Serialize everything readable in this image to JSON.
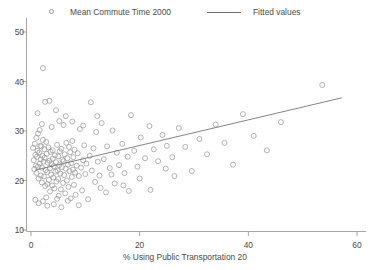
{
  "legend": {
    "entries": [
      {
        "label": "Mean Commute Time 2000",
        "marker": "circle-marker-icon"
      },
      {
        "label": "Fitted values",
        "marker": "line-marker-icon"
      }
    ]
  },
  "axes": {
    "xlabel": "% Using Public Transportation 20",
    "ylabel": "",
    "xticks": [
      "0",
      "20",
      "40",
      "60"
    ],
    "yticks": [
      "10",
      "20",
      "30",
      "40",
      "50"
    ]
  },
  "colors": {
    "marker": "#9a9a9a",
    "line": "#6e6e6e",
    "axis": "#8f8f8f",
    "text": "#4a4a4a",
    "background": "#ffffff"
  },
  "chart_data": {
    "type": "scatter",
    "title": "",
    "xlabel": "% Using Public Transportation 20",
    "ylabel": "",
    "xlim": [
      0,
      60
    ],
    "ylim": [
      10,
      52
    ],
    "xticks": [
      0,
      20,
      40,
      60
    ],
    "yticks": [
      10,
      20,
      30,
      40,
      50
    ],
    "grid": false,
    "legend_position": "top",
    "series": [
      {
        "name": "Mean Commute Time 2000",
        "type": "scatter",
        "marker": "open-circle",
        "points": [
          [
            0.4,
            26.6
          ],
          [
            0.5,
            24.1
          ],
          [
            0.6,
            22.3
          ],
          [
            0.7,
            27.4
          ],
          [
            0.8,
            25.2
          ],
          [
            0.9,
            23.0
          ],
          [
            1.0,
            28.6
          ],
          [
            1.0,
            21.5
          ],
          [
            1.1,
            24.8
          ],
          [
            1.2,
            26.0
          ],
          [
            1.3,
            22.8
          ],
          [
            1.3,
            29.5
          ],
          [
            1.4,
            20.4
          ],
          [
            1.5,
            25.6
          ],
          [
            1.6,
            23.4
          ],
          [
            1.7,
            27.0
          ],
          [
            1.8,
            21.0
          ],
          [
            1.8,
            24.3
          ],
          [
            1.9,
            26.9
          ],
          [
            2.0,
            19.6
          ],
          [
            2.0,
            22.6
          ],
          [
            2.1,
            25.0
          ],
          [
            2.2,
            42.7
          ],
          [
            2.2,
            28.2
          ],
          [
            2.3,
            23.8
          ],
          [
            2.4,
            20.8
          ],
          [
            2.5,
            26.3
          ],
          [
            2.5,
            24.6
          ],
          [
            2.6,
            18.9
          ],
          [
            2.7,
            22.1
          ],
          [
            2.8,
            27.8
          ],
          [
            2.9,
            25.4
          ],
          [
            3.0,
            21.7
          ],
          [
            3.0,
            19.3
          ],
          [
            3.1,
            23.6
          ],
          [
            3.2,
            26.7
          ],
          [
            3.3,
            20.1
          ],
          [
            3.4,
            24.0
          ],
          [
            3.5,
            22.5
          ],
          [
            3.5,
            17.8
          ],
          [
            3.6,
            25.8
          ],
          [
            3.7,
            21.2
          ],
          [
            3.8,
            23.3
          ],
          [
            3.9,
            19.0
          ],
          [
            4.0,
            26.1
          ],
          [
            4.0,
            24.4
          ],
          [
            4.1,
            20.6
          ],
          [
            4.2,
            22.9
          ],
          [
            4.3,
            18.4
          ],
          [
            4.4,
            25.1
          ],
          [
            4.5,
            21.8
          ],
          [
            4.6,
            23.7
          ],
          [
            4.7,
            19.8
          ],
          [
            4.8,
            27.2
          ],
          [
            4.9,
            22.0
          ],
          [
            5.0,
            24.9
          ],
          [
            5.0,
            20.3
          ],
          [
            5.1,
            16.9
          ],
          [
            5.2,
            23.1
          ],
          [
            5.3,
            25.9
          ],
          [
            5.4,
            21.4
          ],
          [
            5.5,
            18.2
          ],
          [
            5.6,
            26.4
          ],
          [
            5.7,
            22.7
          ],
          [
            5.8,
            24.2
          ],
          [
            5.9,
            19.5
          ],
          [
            6.0,
            23.9
          ],
          [
            6.0,
            31.2
          ],
          [
            6.1,
            21.1
          ],
          [
            6.2,
            25.3
          ],
          [
            6.3,
            17.4
          ],
          [
            6.4,
            22.4
          ],
          [
            6.5,
            27.6
          ],
          [
            6.6,
            20.0
          ],
          [
            6.7,
            24.5
          ],
          [
            6.8,
            23.2
          ],
          [
            6.9,
            18.7
          ],
          [
            7.0,
            26.8
          ],
          [
            7.1,
            21.9
          ],
          [
            7.2,
            25.7
          ],
          [
            7.3,
            16.4
          ],
          [
            7.4,
            23.5
          ],
          [
            7.5,
            20.7
          ],
          [
            7.6,
            28.0
          ],
          [
            7.7,
            22.2
          ],
          [
            7.8,
            24.7
          ],
          [
            7.9,
            19.1
          ],
          [
            8.0,
            26.2
          ],
          [
            8.1,
            21.6
          ],
          [
            8.2,
            17.1
          ],
          [
            8.4,
            23.0
          ],
          [
            8.6,
            25.5
          ],
          [
            8.8,
            20.9
          ],
          [
            9.0,
            30.4
          ],
          [
            9.2,
            22.6
          ],
          [
            9.4,
            18.0
          ],
          [
            9.6,
            24.1
          ],
          [
            9.8,
            27.1
          ],
          [
            10.0,
            21.3
          ],
          [
            10.2,
            23.4
          ],
          [
            10.5,
            16.2
          ],
          [
            10.8,
            25.0
          ],
          [
            11.0,
            35.8
          ],
          [
            11.2,
            22.0
          ],
          [
            11.5,
            26.5
          ],
          [
            11.8,
            19.7
          ],
          [
            12.0,
            29.8
          ],
          [
            12.3,
            23.8
          ],
          [
            12.6,
            21.0
          ],
          [
            13.0,
            31.6
          ],
          [
            13.4,
            24.3
          ],
          [
            13.8,
            17.6
          ],
          [
            14.0,
            26.9
          ],
          [
            14.5,
            22.5
          ],
          [
            15.0,
            30.1
          ],
          [
            15.4,
            19.4
          ],
          [
            15.8,
            25.6
          ],
          [
            16.2,
            23.1
          ],
          [
            16.8,
            27.4
          ],
          [
            17.2,
            21.5
          ],
          [
            17.8,
            24.8
          ],
          [
            18.4,
            33.2
          ],
          [
            19.0,
            26.0
          ],
          [
            19.6,
            22.8
          ],
          [
            20.2,
            28.7
          ],
          [
            21.0,
            24.5
          ],
          [
            21.8,
            31.0
          ],
          [
            22.6,
            26.3
          ],
          [
            23.4,
            23.9
          ],
          [
            24.2,
            29.2
          ],
          [
            25.0,
            27.0
          ],
          [
            26.0,
            24.7
          ],
          [
            27.2,
            30.6
          ],
          [
            28.4,
            26.8
          ],
          [
            29.6,
            21.9
          ],
          [
            31.0,
            28.4
          ],
          [
            32.4,
            25.3
          ],
          [
            34.0,
            31.3
          ],
          [
            35.6,
            27.6
          ],
          [
            37.2,
            23.2
          ],
          [
            39.0,
            33.4
          ],
          [
            41.0,
            29.0
          ],
          [
            43.4,
            26.1
          ],
          [
            46.0,
            31.8
          ],
          [
            53.6,
            39.3
          ],
          [
            1.2,
            33.6
          ],
          [
            2.6,
            35.9
          ],
          [
            3.4,
            36.1
          ],
          [
            4.6,
            34.2
          ],
          [
            5.2,
            32.0
          ],
          [
            2.0,
            31.4
          ],
          [
            6.4,
            33.0
          ],
          [
            3.8,
            30.8
          ],
          [
            1.6,
            30.2
          ],
          [
            7.6,
            31.9
          ],
          [
            0.8,
            16.1
          ],
          [
            1.4,
            15.4
          ],
          [
            2.2,
            15.8
          ],
          [
            3.0,
            14.9
          ],
          [
            4.2,
            15.2
          ],
          [
            5.6,
            14.6
          ],
          [
            6.8,
            15.9
          ],
          [
            2.8,
            16.6
          ],
          [
            4.8,
            16.3
          ],
          [
            8.8,
            15.0
          ],
          [
            9.6,
            31.1
          ],
          [
            12.8,
            18.5
          ],
          [
            14.8,
            21.2
          ],
          [
            17.0,
            19.0
          ],
          [
            20.0,
            20.4
          ],
          [
            22.0,
            18.1
          ],
          [
            24.8,
            22.4
          ],
          [
            12.2,
            33.0
          ],
          [
            18.0,
            17.9
          ],
          [
            26.4,
            20.9
          ]
        ]
      },
      {
        "name": "Fitted values",
        "type": "line",
        "points": [
          [
            0.8,
            22.1
          ],
          [
            57.2,
            36.7
          ]
        ]
      }
    ]
  }
}
